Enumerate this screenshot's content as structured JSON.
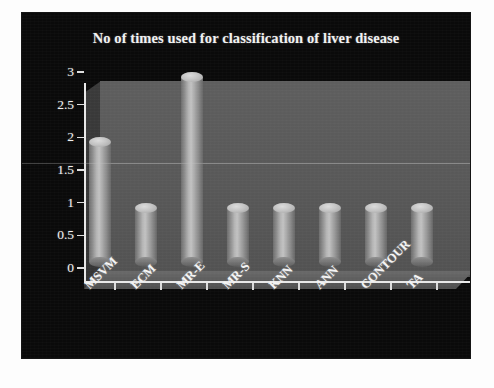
{
  "chart_data": {
    "type": "bar",
    "title": "No of times used for classification of liver disease",
    "xlabel": "",
    "ylabel": "",
    "categories": [
      "MSVM",
      "ECM",
      "MR-E",
      "MR-S",
      "KNN",
      "ANN",
      "CONTOUR",
      "TA"
    ],
    "values": [
      2,
      1,
      3,
      1,
      1,
      1,
      1,
      1
    ],
    "ylim": [
      0,
      3
    ],
    "ytick_labels": [
      "0",
      "0.5",
      "1",
      "1.5",
      "2",
      "2.5",
      "3"
    ],
    "ytick_values": [
      0,
      0.5,
      1,
      1.5,
      2,
      2.5,
      3
    ],
    "grid": true,
    "legend": false,
    "style": "3d-cylinder",
    "series": [
      {
        "name": "No of times used",
        "values": [
          2,
          1,
          3,
          1,
          1,
          1,
          1,
          1
        ]
      }
    ]
  },
  "colors": {
    "background": "#0a0a0a",
    "page": "#fdfdfd",
    "plot_wall": "#5a5a5a",
    "plot_floor": "#6a6a6a",
    "bar": "#b4b4b4",
    "axis": "#e8e8e8",
    "text": "#f2f2f2"
  }
}
